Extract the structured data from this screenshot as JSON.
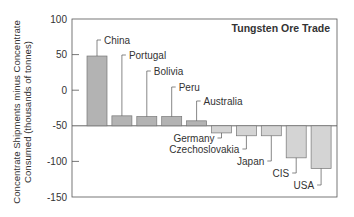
{
  "chart_data": {
    "type": "bar",
    "title": "Tungsten Ore Trade",
    "xlabel": "",
    "ylabel": "Concentrate Shipments minus Concentrate Consumed (thousands of tonnes)",
    "ylabel_lines": [
      "Concentrate Shipments minus Concentrate",
      "Consumed (thousands of tonnes)"
    ],
    "ylim": [
      -150,
      100
    ],
    "baseline": -50,
    "yticks": [
      100,
      50,
      0,
      -50,
      -100,
      -150
    ],
    "grid": false,
    "legend": null,
    "categories": [
      "China",
      "Portugal",
      "Bolivia",
      "Peru",
      "Australia",
      "Germany",
      "Czechoslovakia",
      "Japan",
      "CIS",
      "USA"
    ],
    "values": [
      48,
      -36,
      -37,
      -37,
      -43,
      -60,
      -64,
      -64,
      -95,
      -110
    ],
    "colors": {
      "above_baseline": "#b3b3b3",
      "below_baseline": "#d4d4d4",
      "axis": "#555555",
      "text": "#333333"
    }
  }
}
